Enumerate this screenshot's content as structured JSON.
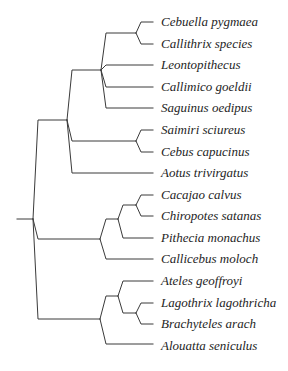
{
  "diagram": {
    "type": "phylogenetic-tree",
    "line_color": "#3a3a3a",
    "text_color": "#1e1e1e",
    "leaves": [
      {
        "label": "Cebuella pygmaea"
      },
      {
        "label": "Callithrix species"
      },
      {
        "label": "Leontopithecus"
      },
      {
        "label": "Callimico goeldii"
      },
      {
        "label": "Saguinus oedipus"
      },
      {
        "label": "Saimiri sciureus"
      },
      {
        "label": "Cebus capucinus"
      },
      {
        "label": "Aotus trivirgatus"
      },
      {
        "label": "Cacajao calvus"
      },
      {
        "label": "Chiropotes satanas"
      },
      {
        "label": "Pithecia monachus"
      },
      {
        "label": "Callicebus moloch"
      },
      {
        "label": "Ateles geoffroyi"
      },
      {
        "label": "Lagothrix lagothricha"
      },
      {
        "label": "Brachyteles arach"
      },
      {
        "label": "Alouatta seniculus"
      }
    ],
    "newick": "(((((Cebuella pygmaea,Callithrix species),Leontopithecus,Callimico goeldii,Saguinus oedipus),(Saimiri sciureus,Cebus capucinus),Aotus trivirgatus),(((Cacajao calvus,Chiropotes satanas),Pithecia monachus),Callicebus moloch),((Ateles geoffroyi,(Lagothrix lagothricha,Brachyteles arach)),Alouatta seniculus)));"
  }
}
